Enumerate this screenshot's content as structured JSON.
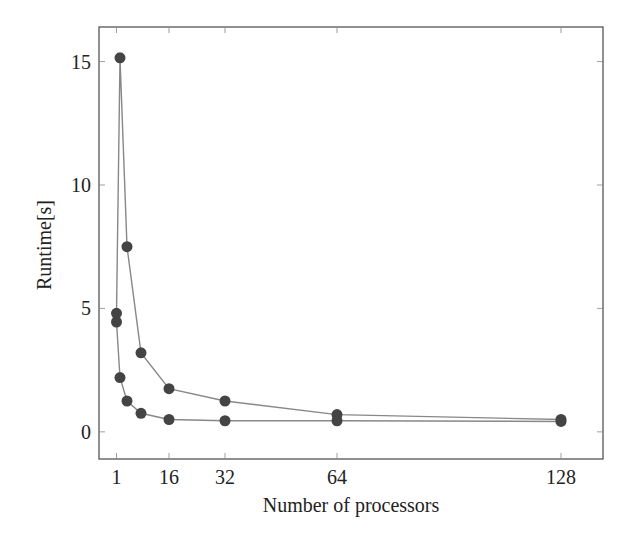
{
  "chart_data": {
    "type": "line",
    "title": "",
    "xlabel": "Number of processors",
    "ylabel": "Runtime[s]",
    "xlim": [
      -4,
      140
    ],
    "ylim": [
      -1.1,
      16.4
    ],
    "x_ticks": [
      1,
      16,
      32,
      64,
      128
    ],
    "y_ticks": [
      0,
      5,
      10,
      15
    ],
    "grid": false,
    "legend": null,
    "marker_color": "#444444",
    "line_color": "#888888",
    "series": [
      {
        "name": "Series A",
        "x": [
          1,
          2,
          4,
          8,
          16,
          32,
          64,
          128
        ],
        "values": [
          4.8,
          15.15,
          7.5,
          3.2,
          1.75,
          1.25,
          0.7,
          0.5
        ]
      },
      {
        "name": "Series B",
        "x": [
          1,
          2,
          4,
          8,
          16,
          32,
          64,
          128
        ],
        "values": [
          4.45,
          2.2,
          1.25,
          0.75,
          0.5,
          0.45,
          0.45,
          0.42
        ]
      }
    ]
  }
}
